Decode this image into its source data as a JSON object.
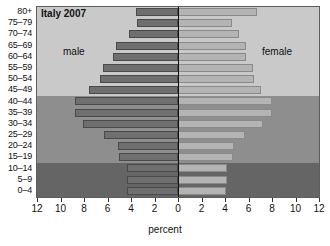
{
  "chart_data": {
    "type": "bar",
    "subtype": "population-pyramid",
    "title": "Italy 2007",
    "xlabel": "percent",
    "ylabel": "",
    "xlim": [
      -12,
      12
    ],
    "xticks": [
      12,
      10,
      8,
      6,
      4,
      2,
      0,
      2,
      4,
      6,
      8,
      10,
      12
    ],
    "grid": false,
    "legend": [
      "male",
      "female"
    ],
    "legend_position": "inside-left-and-right",
    "categories": [
      "0–4",
      "5–9",
      "10–14",
      "15–19",
      "20–24",
      "25–29",
      "30–34",
      "35–39",
      "40–44",
      "45–49",
      "50–54",
      "55–59",
      "60–64",
      "65–69",
      "70–74",
      "75–79",
      "80+"
    ],
    "series": [
      {
        "name": "male",
        "side": "left",
        "values": [
          4.3,
          4.3,
          4.3,
          5.0,
          5.1,
          6.3,
          8.1,
          8.8,
          8.8,
          7.6,
          6.6,
          6.4,
          5.5,
          5.3,
          4.2,
          3.5,
          3.6
        ]
      },
      {
        "name": "female",
        "side": "right",
        "values": [
          4.1,
          4.2,
          4.2,
          4.7,
          4.8,
          5.7,
          7.2,
          8.0,
          8.0,
          7.1,
          6.5,
          6.4,
          5.8,
          5.8,
          5.2,
          4.6,
          6.7
        ]
      }
    ],
    "bands": [
      {
        "name": "youth",
        "categories": [
          "0–4",
          "5–9",
          "10–14"
        ],
        "color": "#656565"
      },
      {
        "name": "working-age",
        "categories": [
          "15–19",
          "20–24",
          "25–29",
          "30–34",
          "35–39",
          "40–44"
        ],
        "color": "#8e8e8e"
      },
      {
        "name": "older",
        "categories": [
          "45–49",
          "50–54",
          "55–59",
          "60–64",
          "65–69",
          "70–74",
          "75–79",
          "80+"
        ],
        "color": "#c9c9c9"
      }
    ],
    "colors": {
      "male_bar": "#6f6f6f",
      "female_bar": "#b4b4b4",
      "zero_line": "#111111",
      "frame": "#5d5d5d"
    }
  },
  "axis": {
    "x_label": "percent",
    "tick_labels": [
      "12",
      "10",
      "8",
      "6",
      "4",
      "2",
      "0",
      "2",
      "4",
      "6",
      "8",
      "10",
      "12"
    ]
  },
  "labels": {
    "title": "Italy 2007",
    "male": "male",
    "female": "female"
  }
}
